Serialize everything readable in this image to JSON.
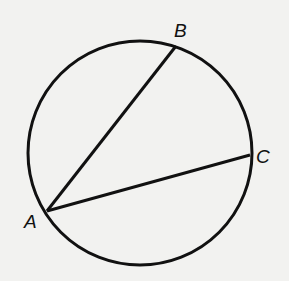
{
  "diagram": {
    "type": "circle-inscribed-angle",
    "circle": {
      "cx": 140,
      "cy": 153,
      "r": 112
    },
    "points": [
      {
        "name": "A",
        "x": 47,
        "y": 211,
        "label_x": 24,
        "label_y": 228
      },
      {
        "name": "B",
        "x": 176,
        "y": 46,
        "label_x": 174,
        "label_y": 37
      },
      {
        "name": "C",
        "x": 250,
        "y": 155,
        "label_x": 256,
        "label_y": 163
      }
    ],
    "segments": [
      {
        "from": "A",
        "to": "B"
      },
      {
        "from": "A",
        "to": "C"
      }
    ],
    "colors": {
      "stroke": "#111111",
      "background": "#f2f2f0"
    }
  }
}
